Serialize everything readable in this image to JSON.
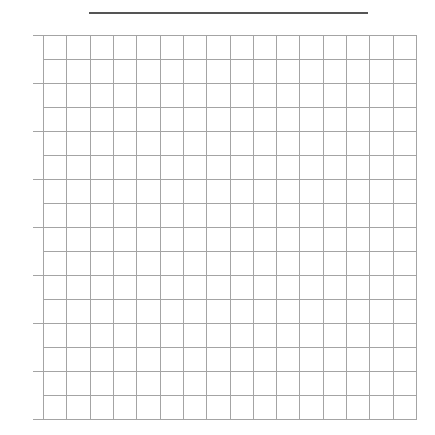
{
  "worksheet": {
    "title_line": {
      "present": true,
      "color": "#555555"
    },
    "grid": {
      "columns": 16,
      "rows": 16,
      "line_color": "#a4a4a4",
      "major_tick_every": 2
    }
  }
}
